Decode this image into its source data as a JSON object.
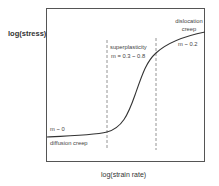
{
  "diagram": {
    "axes": {
      "y_label": "log(stress)",
      "x_label": "log(strain rate)"
    },
    "regions": [
      {
        "name": "diffusion creep",
        "slope_label": "m ~ 0"
      },
      {
        "name": "superplasticity",
        "slope_label": "m = 0.3 ~ 0.8"
      },
      {
        "name_line1": "dislocation",
        "name_line2": "creep",
        "slope_label": "m ~ 0.2"
      }
    ],
    "colors": {
      "curve": "#333333",
      "frame": "#555555",
      "dashed": "#888888"
    }
  }
}
